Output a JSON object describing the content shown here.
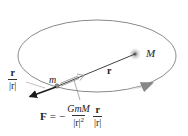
{
  "diagram": {
    "labels": {
      "large_mass": "M",
      "small_mass": "m",
      "radius_vector": "r",
      "unit_vector_num": "r",
      "unit_vector_den": "|r|"
    },
    "formula": {
      "lhs": "F",
      "equals": "=",
      "sign": "−",
      "frac1_num": "GmM",
      "frac1_den": "|r|",
      "frac1_den_exp": "2",
      "frac2_num": "r",
      "frac2_den": "|r|"
    },
    "colors": {
      "orbit": "#8a8a8a",
      "line": "#444444",
      "force_arrow": "#1a1a1a",
      "mass_glow": "#d0d0d0",
      "mass_core": "#777777"
    }
  }
}
